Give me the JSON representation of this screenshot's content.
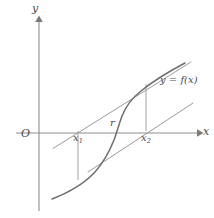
{
  "figure": {
    "type": "diagram",
    "background_color": "#ffffff",
    "axes": {
      "x_axis_label": "x",
      "y_axis_label": "y",
      "origin_label": "O",
      "axis_color": "#8d8d8d",
      "x_axis_y_px": 133,
      "y_axis_x_px": 39,
      "x_axis_start_px": 16,
      "x_axis_end_px": 200,
      "y_axis_top_px": 18,
      "y_axis_bottom_px": 211
    },
    "labels": {
      "x1": "x",
      "x1_sub": "1",
      "x2": "x",
      "x2_sub": "2",
      "root": "r",
      "function": "y = f(x)"
    },
    "points": {
      "x1_px": 78,
      "x2_px": 146,
      "root_px": 118
    },
    "curve": {
      "name": "y = f(x)",
      "shape": "increasing-S-shaped-cubic",
      "color": "#6e6e6e",
      "stroke_width": 1.5,
      "crosses_x_axis_at": "r"
    },
    "tangents": [
      {
        "name": "tangent-at-x2",
        "description": "tangent to curve at the point above x2, crossing the x-axis at x1",
        "color": "#9a9a9a"
      },
      {
        "name": "tangent-lower",
        "description": "tangent to curve at the point below x1, crossing the x-axis at x2",
        "color": "#9a9a9a"
      }
    ],
    "drop_lines": [
      {
        "name": "drop-line-x1",
        "from": "x1-on-axis",
        "to": "curve-below-axis"
      },
      {
        "name": "drop-line-x2",
        "from": "x2-on-axis",
        "to": "curve-above-axis"
      }
    ]
  }
}
